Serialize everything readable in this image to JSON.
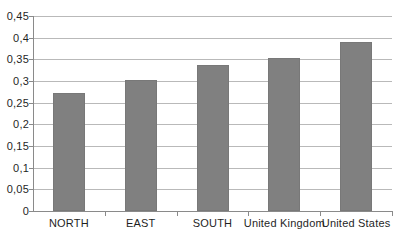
{
  "chart_data": {
    "type": "bar",
    "title": "",
    "subtitle": "",
    "xlabel": "",
    "ylabel": "",
    "categories": [
      "NORTH",
      "EAST",
      "SOUTH",
      "United Kingdom",
      "United States"
    ],
    "values": [
      0.273,
      0.303,
      0.336,
      0.353,
      0.391
    ],
    "ylim": [
      0,
      0.45
    ],
    "ytick_values": [
      0,
      0.05,
      0.1,
      0.15,
      0.2,
      0.25,
      0.3,
      0.35,
      0.4,
      0.45
    ],
    "ytick_labels": [
      "0",
      "0,05",
      "0,1",
      "0,15",
      "0,2",
      "0,25",
      "0,3",
      "0,35",
      "0,4",
      "0,45"
    ],
    "decimal_separator": ",",
    "grid": "horizontal",
    "legend": "none",
    "series": [
      {
        "name": "",
        "values": [
          0.273,
          0.303,
          0.336,
          0.353,
          0.391
        ],
        "color": "#808080"
      }
    ],
    "colors": {
      "bar_fill": "#808080",
      "gridline": "#b9b9b9",
      "axis_line": "#8a8a8a",
      "background": "#ffffff",
      "text": "#1f1f1f"
    }
  }
}
